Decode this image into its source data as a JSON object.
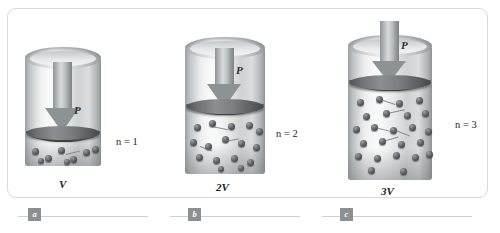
{
  "figure": {
    "type": "physics-diagram",
    "panel_count": 3
  },
  "panels": [
    {
      "id": "a",
      "volume_label": "V",
      "moles_label": "n = 1",
      "moles_value": 1,
      "pressure_label": "P",
      "molecule_count": 8,
      "caption_marker": "a"
    },
    {
      "id": "b",
      "volume_label": "2V",
      "moles_label": "n = 2",
      "moles_value": 2,
      "pressure_label": "P",
      "molecule_count": 16,
      "caption_marker": "b"
    },
    {
      "id": "c",
      "volume_label": "3V",
      "moles_label": "n = 3",
      "moles_value": 3,
      "pressure_label": "P",
      "molecule_count": 24,
      "caption_marker": "c"
    }
  ],
  "captions": {
    "marker_a": "a",
    "marker_b": "b",
    "marker_c": "c"
  },
  "colors": {
    "frame_border": "#d7d9da",
    "cylinder_light": "#f4f5f5",
    "cylinder_dark": "#8d9294",
    "piston_dark": "#45484b",
    "molecule": "#45484b",
    "arrow": "#8d9295",
    "caption_marker_bg": "#8c9093",
    "text": "#1c1e20",
    "background": "#ffffff"
  }
}
